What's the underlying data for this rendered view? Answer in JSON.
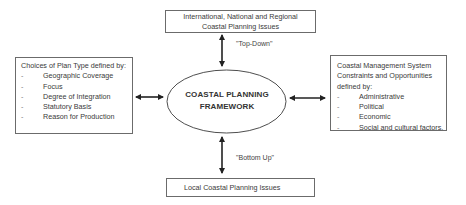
{
  "diagram": {
    "center": {
      "line1": "COASTAL PLANNING",
      "line2": "FRAMEWORK"
    },
    "top_box": {
      "line1": "International, National and Regional",
      "line2": "Coastal Planning Issues"
    },
    "bottom_box": {
      "text": "Local Coastal Planning Issues"
    },
    "top_arrow_label": "\"Top-Down\"",
    "bottom_arrow_label": "\"Bottom Up\"",
    "left_box": {
      "heading": "Choices of Plan Type defined by:",
      "items": [
        "Geographic Coverage",
        "Focus",
        "Degree of Integration",
        "Statutory Basis",
        "Reason for Production"
      ]
    },
    "right_box": {
      "heading_line1": "Coastal Management System",
      "heading_line2": "Constraints and Opportunities",
      "heading_line3": "defined by:",
      "items": [
        "Administrative",
        "Political",
        "Economic",
        "Social and cultural factors."
      ]
    },
    "bullet": "-",
    "colors": {
      "line": "#2a2a2a",
      "border": "#6b6b6b",
      "text": "#3a3a3a"
    }
  }
}
